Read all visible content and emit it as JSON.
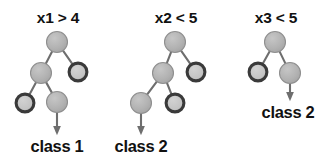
{
  "figure": {
    "kind": "decision-tree-diagram",
    "background_color": "#ffffff",
    "node_fill_light": "#b3b3b3",
    "node_fill_hollow": "#c9c9c9",
    "node_stroke_light": "#8f8f8f",
    "node_stroke_dark": "#3a3a3a",
    "edge_color": "#6e6e6e",
    "arrow_color": "#6e6e6e",
    "text_color": "#111111",
    "node_radius": 10.5,
    "trees": [
      {
        "id": "tree-1",
        "condition_label": "x1 > 4",
        "condition_pos": {
          "x": 58,
          "y": 10
        },
        "outcome_label": "class 1",
        "outcome_pos": {
          "x": 57,
          "y": 138
        },
        "nodes": [
          {
            "id": "t1-root",
            "x": 57,
            "y": 42,
            "style": "filled"
          },
          {
            "id": "t1-left",
            "x": 41,
            "y": 73,
            "style": "filled"
          },
          {
            "id": "t1-right",
            "x": 78,
            "y": 72,
            "style": "ring"
          },
          {
            "id": "t1-left-left",
            "x": 25,
            "y": 103,
            "style": "ring"
          },
          {
            "id": "t1-left-right",
            "x": 57,
            "y": 102,
            "style": "filled"
          }
        ],
        "edges": [
          {
            "from": "t1-root",
            "to": "t1-left"
          },
          {
            "from": "t1-root",
            "to": "t1-right"
          },
          {
            "from": "t1-left",
            "to": "t1-left-left"
          },
          {
            "from": "t1-left",
            "to": "t1-left-right"
          }
        ],
        "arrow": {
          "from": "t1-left-right",
          "x": 57,
          "y1": 111,
          "y2": 132
        }
      },
      {
        "id": "tree-2",
        "condition_label": "x2 < 5",
        "condition_pos": {
          "x": 176,
          "y": 10
        },
        "outcome_label": "class 2",
        "outcome_pos": {
          "x": 141,
          "y": 138
        },
        "nodes": [
          {
            "id": "t2-root",
            "x": 175,
            "y": 42,
            "style": "filled"
          },
          {
            "id": "t2-left",
            "x": 163,
            "y": 73,
            "style": "filled"
          },
          {
            "id": "t2-right",
            "x": 196,
            "y": 72,
            "style": "ring"
          },
          {
            "id": "t2-left-left",
            "x": 141,
            "y": 103,
            "style": "filled"
          },
          {
            "id": "t2-left-right",
            "x": 175,
            "y": 103,
            "style": "ring"
          }
        ],
        "edges": [
          {
            "from": "t2-root",
            "to": "t2-left"
          },
          {
            "from": "t2-root",
            "to": "t2-right"
          },
          {
            "from": "t2-left",
            "to": "t2-left-left"
          },
          {
            "from": "t2-left",
            "to": "t2-left-right"
          }
        ],
        "arrow": {
          "from": "t2-left-left",
          "x": 141,
          "y1": 112,
          "y2": 132
        }
      },
      {
        "id": "tree-3",
        "condition_label": "x3 < 5",
        "condition_pos": {
          "x": 276,
          "y": 10
        },
        "outcome_label": "class 2",
        "outcome_pos": {
          "x": 288,
          "y": 104
        },
        "nodes": [
          {
            "id": "t3-root",
            "x": 275,
            "y": 42,
            "style": "filled"
          },
          {
            "id": "t3-left",
            "x": 258,
            "y": 72,
            "style": "ring"
          },
          {
            "id": "t3-right",
            "x": 290,
            "y": 73,
            "style": "filled"
          }
        ],
        "edges": [
          {
            "from": "t3-root",
            "to": "t3-left"
          },
          {
            "from": "t3-root",
            "to": "t3-right"
          }
        ],
        "arrow": {
          "from": "t3-right",
          "x": 290,
          "y1": 82,
          "y2": 98
        }
      }
    ]
  }
}
